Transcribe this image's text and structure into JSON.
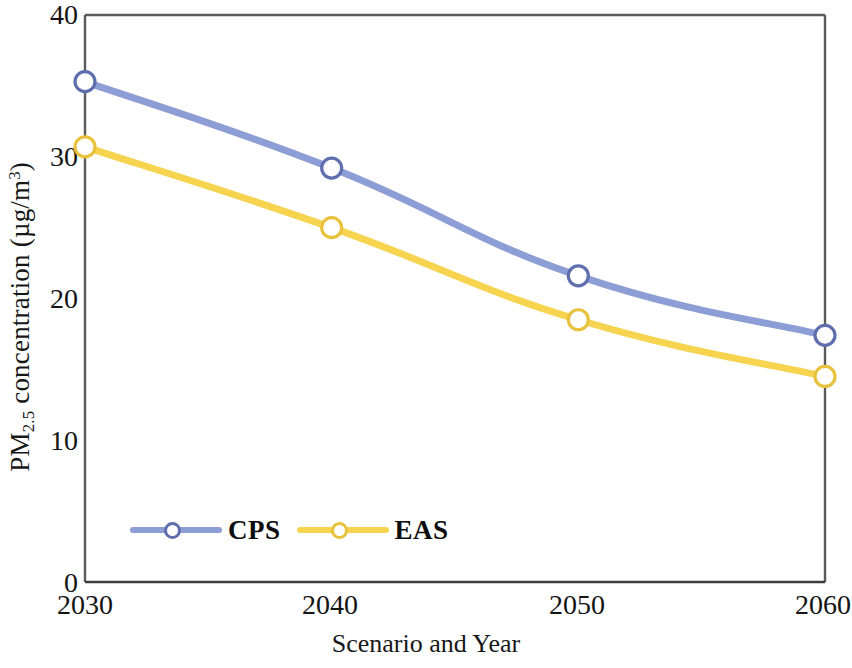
{
  "chart_data": {
    "type": "line",
    "title": "",
    "xlabel": "Scenario and Year",
    "ylabel": "PM2.5 concentration (µg/m³)",
    "ylabel_parts": {
      "prefix": "PM",
      "subscript": "2.5",
      "middle": " concentration (µg/m",
      "superscript": "3",
      "suffix": ")"
    },
    "categories": [
      "2030",
      "2040",
      "2050",
      "2060"
    ],
    "x": [
      2030,
      2040,
      2050,
      2060
    ],
    "xlim": [
      2030,
      2060
    ],
    "ylim": [
      0,
      40
    ],
    "yticks": [
      0,
      10,
      20,
      30,
      40
    ],
    "ytick_labels": [
      "0",
      "10",
      "20",
      "30",
      "40"
    ],
    "xtick_labels": [
      "2030",
      "2040",
      "2050",
      "2060"
    ],
    "grid": false,
    "legend_position": "bottom-left-inside",
    "marker": "open-circle",
    "series": [
      {
        "name": "CPS",
        "color": "#8d9ed6",
        "values": [
          35.3,
          29.2,
          21.6,
          17.4
        ]
      },
      {
        "name": "EAS",
        "color": "#f6d450",
        "values": [
          30.7,
          25.0,
          18.5,
          14.5
        ]
      }
    ]
  },
  "axis": {
    "frame_color": "#4a4a4a",
    "y_title": "PM2.5 concentration (µg/m3)",
    "x_title": "Scenario and Year"
  },
  "legend": {
    "entries": [
      {
        "label": "CPS",
        "color": "#8d9ed6"
      },
      {
        "label": "EAS",
        "color": "#f6d450"
      }
    ]
  }
}
